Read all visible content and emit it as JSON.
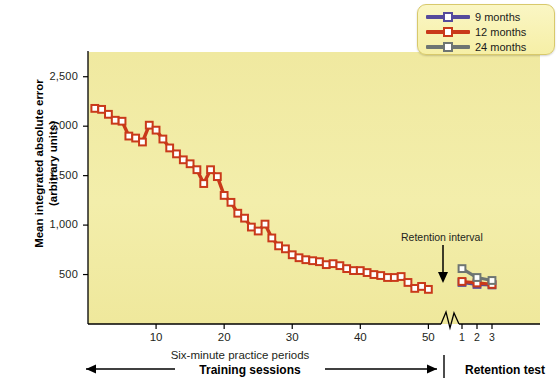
{
  "chart_data": {
    "type": "line",
    "title": "",
    "xlabel": "Six-minute practice periods",
    "ylabel": "Mean integrated absolute error (arbitrary units)",
    "ylabel_line1": "Mean integrated absolute error",
    "ylabel_line2": "(arbitrary units)",
    "ylim": [
      0,
      2750
    ],
    "yticks": [
      500,
      1000,
      1500,
      2000,
      2500
    ],
    "ytick_labels": [
      "500",
      "1,000",
      "1,500",
      "2,000",
      "2,500"
    ],
    "xlim": [
      0,
      52
    ],
    "xticks": [
      10,
      20,
      30,
      40,
      50
    ],
    "xtick_labels": [
      "10",
      "20",
      "30",
      "40",
      "50"
    ],
    "retention_ticks": [
      1,
      2,
      3
    ],
    "retention_tick_labels": [
      "1",
      "2",
      "3"
    ],
    "grid": false,
    "axis_break": true,
    "legend_position": "top-right",
    "background_color": "#f0e9a0",
    "series": [
      {
        "name": "9 months",
        "color": "#554a9c",
        "marker": "square",
        "training_visible": false,
        "retention_x": [
          1,
          2,
          3
        ],
        "retention_values": [
          420,
          400,
          395
        ]
      },
      {
        "name": "12 months",
        "color": "#c9391a",
        "marker": "square",
        "training_visible": true,
        "x": [
          1,
          2,
          3,
          4,
          5,
          6,
          7,
          8,
          9,
          10,
          11,
          12,
          13,
          14,
          15,
          16,
          17,
          18,
          19,
          20,
          21,
          22,
          23,
          24,
          25,
          26,
          27,
          28,
          29,
          30,
          31,
          32,
          33,
          34,
          35,
          36,
          37,
          38,
          39,
          40,
          41,
          42,
          43,
          44,
          45,
          46,
          47,
          48,
          49,
          50
        ],
        "values": [
          2180,
          2170,
          2120,
          2060,
          2050,
          1900,
          1880,
          1840,
          2010,
          1960,
          1870,
          1780,
          1720,
          1660,
          1620,
          1560,
          1420,
          1560,
          1490,
          1300,
          1230,
          1120,
          1070,
          980,
          940,
          1010,
          870,
          790,
          760,
          700,
          670,
          650,
          640,
          630,
          600,
          610,
          590,
          560,
          540,
          540,
          520,
          500,
          490,
          470,
          470,
          480,
          420,
          360,
          380,
          350
        ],
        "retention_x": [
          1,
          2,
          3
        ],
        "retention_values": [
          430,
          415,
          400
        ]
      },
      {
        "name": "24 months",
        "color": "#6e7572",
        "marker": "square",
        "training_visible": false,
        "retention_x": [
          1,
          2,
          3
        ],
        "retention_values": [
          560,
          470,
          440
        ]
      }
    ],
    "annotations": [
      {
        "text": "Retention interval",
        "type": "arrow-label"
      }
    ],
    "brackets": [
      {
        "label": "Training sessions",
        "from": 0,
        "to": 50
      },
      {
        "label": "Retention test",
        "from": 1,
        "to": 3
      }
    ]
  },
  "legend": {
    "items": [
      {
        "label": "9 months",
        "color": "#554a9c"
      },
      {
        "label": "12 months",
        "color": "#c9391a"
      },
      {
        "label": "24 months",
        "color": "#6e7572"
      }
    ]
  },
  "annotations": {
    "retention_interval": "Retention interval"
  },
  "axis": {
    "y_title_line1": "Mean integrated absolute error",
    "y_title_line2": "(arbitrary units)",
    "x_title": "Six-minute practice periods"
  },
  "brackets": {
    "training": "Training sessions",
    "retention": "Retention test"
  }
}
